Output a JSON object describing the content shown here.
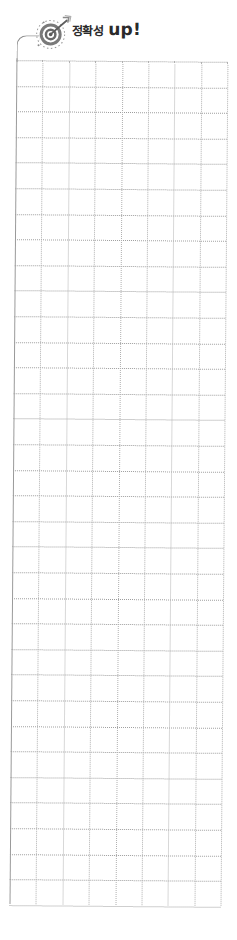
{
  "header": {
    "icon": "target-arrow-icon",
    "title_korean": "정확성",
    "title_suffix": "up!"
  },
  "grid": {
    "rows": 33,
    "columns": 8,
    "cell_width_px": 26.4,
    "cell_height_px": 25.6,
    "line_style": "dotted",
    "line_color": "#9d9d9d",
    "border_color": "#9a9a9a"
  },
  "colors": {
    "title_text": "#2a2a2a",
    "icon_gray": "#6e6e6e",
    "background": "#ffffff"
  }
}
